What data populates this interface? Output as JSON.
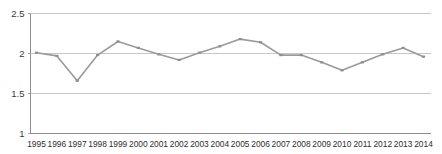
{
  "chart_data": {
    "type": "line",
    "title": "",
    "subtitle": "",
    "xlabel": "",
    "ylabel": "",
    "categories": [
      "1995",
      "1996",
      "1997",
      "1998",
      "1999",
      "2000",
      "2001",
      "2002",
      "2003",
      "2004",
      "2005",
      "2006",
      "2007",
      "2008",
      "2009",
      "2010",
      "2011",
      "2012",
      "2013",
      "2014"
    ],
    "x": [
      1995,
      1996,
      1997,
      1998,
      1999,
      2000,
      2001,
      2002,
      2003,
      2004,
      2005,
      2006,
      2007,
      2008,
      2009,
      2010,
      2011,
      2012,
      2013,
      2014
    ],
    "values": [
      2.01,
      1.97,
      1.66,
      1.98,
      2.15,
      2.07,
      1.99,
      1.92,
      2.01,
      2.09,
      2.18,
      2.14,
      1.98,
      1.98,
      1.89,
      1.79,
      1.89,
      1.99,
      2.07,
      1.96
    ],
    "series": [
      {
        "name": "series-1",
        "values": [
          2.01,
          1.97,
          1.66,
          1.98,
          2.15,
          2.07,
          1.99,
          1.92,
          2.01,
          2.09,
          2.18,
          2.14,
          1.98,
          1.98,
          1.89,
          1.79,
          1.89,
          1.99,
          2.07,
          1.96
        ]
      }
    ],
    "ylim": [
      1,
      2.5
    ],
    "yticks": [
      1,
      1.5,
      2,
      2.5
    ],
    "ytick_labels": [
      "1",
      "1.5",
      "2",
      "2.5"
    ],
    "xtick_labels": [
      "1995",
      "1996",
      "1997",
      "1998",
      "1999",
      "2000",
      "2001",
      "2002",
      "2003",
      "2004",
      "2005",
      "2006",
      "2007",
      "2008",
      "2009",
      "2010",
      "2011",
      "2012",
      "2013",
      "2014"
    ],
    "grid": true,
    "grid_axis": "y",
    "legend": false,
    "legend_position": "none",
    "annotations": [],
    "colors": {
      "line": "#9a9a9a",
      "marker": "#8f8f8f",
      "grid": "#b9b9b9",
      "axis": "#8e8e8e",
      "tick_text": "#2e2e2e",
      "background": "#ffffff"
    }
  }
}
